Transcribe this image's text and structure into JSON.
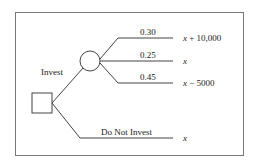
{
  "diagram": {
    "type": "decision-tree",
    "decision_node": {
      "shape": "square"
    },
    "chance_node": {
      "shape": "circle"
    },
    "branches": [
      {
        "label": "Invest",
        "outcomes": [
          {
            "probability": "0.30",
            "variable": "x",
            "suffix": " + 10,000"
          },
          {
            "probability": "0.25",
            "variable": "x",
            "suffix": ""
          },
          {
            "probability": "0.45",
            "variable": "x",
            "suffix": " − 5000"
          }
        ]
      },
      {
        "label": "Do Not Invest",
        "outcome": {
          "variable": "x",
          "suffix": ""
        }
      }
    ],
    "colors": {
      "line": "#444444",
      "border": "#666666",
      "background": "#ffffff"
    }
  }
}
